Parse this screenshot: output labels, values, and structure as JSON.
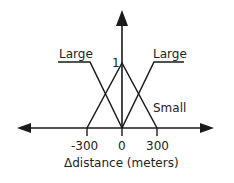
{
  "diagram": {
    "type": "fuzzy-membership-functions",
    "y_axis": {
      "peak_label": "1"
    },
    "x_axis": {
      "label": "Δdistance (meters)",
      "ticks": [
        "-300",
        "0",
        "300"
      ]
    },
    "sets": [
      {
        "name": "Large",
        "side": "left",
        "shape": "Z",
        "label": "Large"
      },
      {
        "name": "Small",
        "shape": "triangle",
        "label": "Small",
        "points": [
          -300,
          0,
          300
        ]
      },
      {
        "name": "Large",
        "side": "right",
        "shape": "S",
        "label": "Large"
      }
    ],
    "colors": {
      "line": "#1a1a1a",
      "background": "#ffffff"
    }
  }
}
